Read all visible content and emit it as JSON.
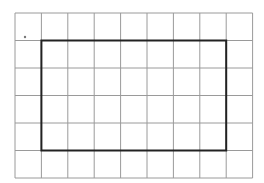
{
  "diagram": {
    "type": "grid-with-rectangle",
    "grid": {
      "columns": 9,
      "rows": 6,
      "origin_x": 15,
      "origin_y": 13,
      "cell_width": 26.4,
      "cell_height": 27.5,
      "line_color": "#9a9a9a"
    },
    "rectangle": {
      "col_start": 1,
      "row_start": 1,
      "col_end": 8,
      "row_end": 5,
      "stroke_color": "#222222",
      "stroke_width": 2
    },
    "marker": {
      "x": 25,
      "y": 37,
      "color": "#777777"
    }
  }
}
